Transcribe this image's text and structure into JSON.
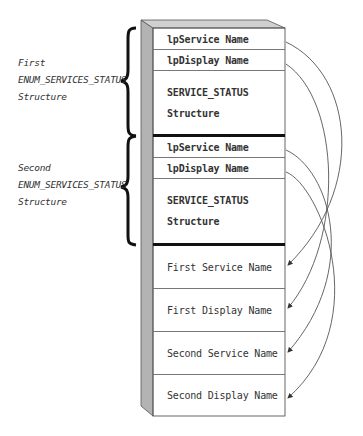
{
  "groups": [
    {
      "line1": "First",
      "line2": "ENUM_SERVICES_STATUS",
      "line3": "Structure"
    },
    {
      "line1": "Second",
      "line2": "ENUM_SERVICES_STATUS",
      "line3": "Structure"
    }
  ],
  "cells": [
    {
      "text": "lpService Name"
    },
    {
      "text": "lpDisplay Name"
    },
    {
      "text": "SERVICE_STATUS",
      "text2": "Structure"
    },
    {
      "text": "lpService Name"
    },
    {
      "text": "lpDisplay Name"
    },
    {
      "text": "SERVICE_STATUS",
      "text2": "Structure"
    },
    {
      "text": "First Service Name"
    },
    {
      "text": "First Display Name"
    },
    {
      "text": "Second Service Name"
    },
    {
      "text": "Second Display Name"
    }
  ],
  "colors": {
    "side_face": "#b3b3b3",
    "top_face": "#d0d0d0",
    "line": "#555555"
  }
}
